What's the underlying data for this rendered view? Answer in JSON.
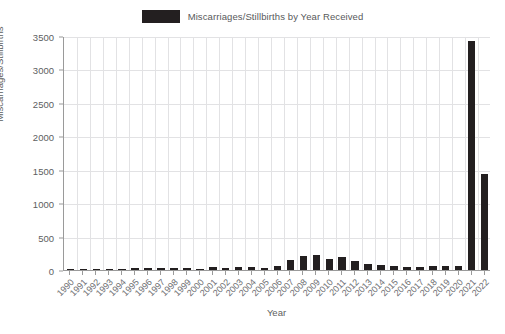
{
  "chart_data": {
    "type": "bar",
    "title": "",
    "legend": [
      {
        "label": "Miscarriages/Stillbirths by Year Received",
        "color": "#231f20"
      }
    ],
    "legend_position": "top-center",
    "xlabel": "Year",
    "ylabel": "Miscarriages/Stillbirths",
    "ylim": [
      0,
      3500
    ],
    "yticks": [
      0,
      500,
      1000,
      1500,
      2000,
      2500,
      3000,
      3500
    ],
    "ytick_labels": [
      "0",
      "500",
      "1000",
      "1500",
      "2000",
      "2500",
      "3000",
      "3500"
    ],
    "grid": true,
    "grid_color": "#e2e2e4",
    "axis_color": "#9a9a9a",
    "bar_color": "#231f20",
    "categories": [
      "1990",
      "1991",
      "1992",
      "1993",
      "1994",
      "1995",
      "1996",
      "1997",
      "1998",
      "1999",
      "2000",
      "2001",
      "2002",
      "2003",
      "2004",
      "2005",
      "2006",
      "2007",
      "2008",
      "2009",
      "2010",
      "2011",
      "2012",
      "2013",
      "2014",
      "2015",
      "2016",
      "2017",
      "2018",
      "2019",
      "2020",
      "2021",
      "2022"
    ],
    "values": [
      5,
      12,
      14,
      16,
      20,
      36,
      30,
      31,
      29,
      25,
      20,
      38,
      36,
      38,
      40,
      30,
      60,
      155,
      215,
      230,
      170,
      200,
      130,
      95,
      70,
      55,
      42,
      50,
      60,
      58,
      60,
      3420,
      1430
    ],
    "series": [
      {
        "name": "Miscarriages/Stillbirths by Year Received",
        "color": "#231f20",
        "values": [
          5,
          12,
          14,
          16,
          20,
          36,
          30,
          31,
          29,
          25,
          20,
          38,
          36,
          38,
          40,
          30,
          60,
          155,
          215,
          230,
          170,
          200,
          130,
          95,
          70,
          55,
          42,
          50,
          60,
          58,
          60,
          3420,
          1430
        ]
      }
    ]
  }
}
